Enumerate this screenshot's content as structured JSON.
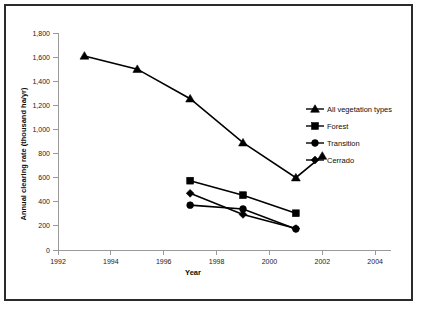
{
  "chart_data": {
    "type": "line",
    "title": "",
    "xlabel": "Year",
    "ylabel": "Annual clearing rate (thousand ha/yr)",
    "xlim": [
      1992,
      2004.6
    ],
    "ylim": [
      0,
      1800
    ],
    "grid": false,
    "legend_position": "right-middle",
    "x_ticks": [
      "1992",
      "1994",
      "1996",
      "1998",
      "2000",
      "2002",
      "2004"
    ],
    "x_tick_values": [
      1992,
      1994,
      1996,
      1998,
      2000,
      2002,
      2004
    ],
    "y_ticks": [
      "0",
      "200",
      "400",
      "600",
      "800",
      "1,000",
      "1,200",
      "1,400",
      "1,600",
      "1,800"
    ],
    "y_tick_values": [
      0,
      200,
      400,
      600,
      800,
      1000,
      1200,
      1400,
      1600,
      1800
    ],
    "series": [
      {
        "name": "All vegetation types",
        "marker": "triangle",
        "x": [
          1993,
          1995,
          1997,
          1999,
          2001,
          2002
        ],
        "values": [
          1610,
          1500,
          1255,
          890,
          600,
          780
        ]
      },
      {
        "name": "Forest",
        "marker": "square",
        "x": [
          1997,
          1999,
          2001
        ],
        "values": [
          575,
          455,
          305
        ]
      },
      {
        "name": "Transition",
        "marker": "circle",
        "x": [
          1997,
          1999,
          2001
        ],
        "values": [
          372,
          340,
          175
        ]
      },
      {
        "name": "Cerrado",
        "marker": "diamond",
        "x": [
          1997,
          1999,
          2001
        ],
        "values": [
          470,
          295,
          178
        ]
      }
    ]
  },
  "legend": {
    "items": [
      {
        "label": "All vegetation types",
        "marker": "triangle"
      },
      {
        "label": "Forest",
        "marker": "square"
      },
      {
        "label": "Transition",
        "marker": "circle"
      },
      {
        "label": "Cerrado",
        "marker": "diamond"
      }
    ]
  },
  "colors": {
    "series": "#000000",
    "axis": "#9a9a9a",
    "text": "#0d0d0d",
    "frame": "#2b2b2b",
    "background": "#ffffff"
  }
}
